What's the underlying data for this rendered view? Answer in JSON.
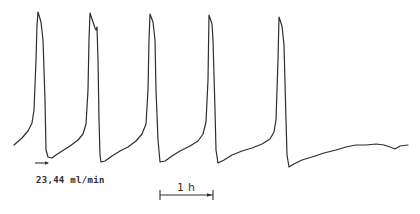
{
  "chart_data": {
    "type": "line",
    "title": "",
    "xlabel": "",
    "ylabel": "",
    "grid": false,
    "legend": "none",
    "series": [
      {
        "name": "trace",
        "points": [
          [
            14,
            145
          ],
          [
            22,
            138
          ],
          [
            28,
            131
          ],
          [
            32,
            123
          ],
          [
            34,
            110
          ],
          [
            36,
            60
          ],
          [
            37,
            25
          ],
          [
            38,
            12
          ],
          [
            41,
            22
          ],
          [
            43,
            40
          ],
          [
            45,
            100
          ],
          [
            46,
            150
          ],
          [
            48,
            157
          ],
          [
            52,
            158
          ],
          [
            56,
            155
          ],
          [
            62,
            151
          ],
          [
            70,
            146
          ],
          [
            78,
            140
          ],
          [
            83,
            134
          ],
          [
            86,
            124
          ],
          [
            88,
            90
          ],
          [
            89,
            40
          ],
          [
            90,
            13
          ],
          [
            93,
            22
          ],
          [
            95,
            28
          ],
          [
            96,
            30
          ],
          [
            97,
            27
          ],
          [
            98,
            60
          ],
          [
            99,
            120
          ],
          [
            100,
            155
          ],
          [
            101,
            162
          ],
          [
            105,
            161
          ],
          [
            112,
            156
          ],
          [
            120,
            151
          ],
          [
            128,
            147
          ],
          [
            136,
            141
          ],
          [
            142,
            134
          ],
          [
            146,
            124
          ],
          [
            148,
            90
          ],
          [
            149,
            40
          ],
          [
            150,
            14
          ],
          [
            153,
            22
          ],
          [
            155,
            40
          ],
          [
            156,
            90
          ],
          [
            158,
            140
          ],
          [
            160,
            162
          ],
          [
            165,
            161
          ],
          [
            172,
            156
          ],
          [
            180,
            151
          ],
          [
            190,
            146
          ],
          [
            198,
            141
          ],
          [
            203,
            134
          ],
          [
            206,
            122
          ],
          [
            208,
            80
          ],
          [
            209,
            15
          ],
          [
            212,
            24
          ],
          [
            213,
            40
          ],
          [
            215,
            110
          ],
          [
            216,
            150
          ],
          [
            218,
            163
          ],
          [
            224,
            160
          ],
          [
            232,
            155
          ],
          [
            242,
            151
          ],
          [
            252,
            148
          ],
          [
            262,
            144
          ],
          [
            270,
            139
          ],
          [
            274,
            132
          ],
          [
            276,
            120
          ],
          [
            278,
            60
          ],
          [
            279,
            17
          ],
          [
            282,
            26
          ],
          [
            284,
            45
          ],
          [
            286,
            120
          ],
          [
            287,
            155
          ],
          [
            289,
            167
          ],
          [
            294,
            164
          ],
          [
            302,
            160
          ],
          [
            312,
            157
          ],
          [
            324,
            153
          ],
          [
            336,
            150
          ],
          [
            346,
            147
          ],
          [
            356,
            145
          ],
          [
            366,
            145
          ],
          [
            376,
            144
          ],
          [
            384,
            145
          ],
          [
            390,
            147
          ],
          [
            395,
            149
          ],
          [
            400,
            146
          ],
          [
            408,
            145
          ]
        ]
      }
    ],
    "annotations": [
      {
        "text": "23,44 ml/min",
        "type": "arrow",
        "from": [
          35,
          163
        ],
        "to": [
          49,
          163
        ]
      },
      {
        "text": "1 h",
        "type": "scale-bar",
        "from": [
          160,
          195
        ],
        "to": [
          213,
          195
        ]
      }
    ]
  },
  "labels": {
    "flow_rate": "23,44 ml/min",
    "scale": "1 h"
  }
}
